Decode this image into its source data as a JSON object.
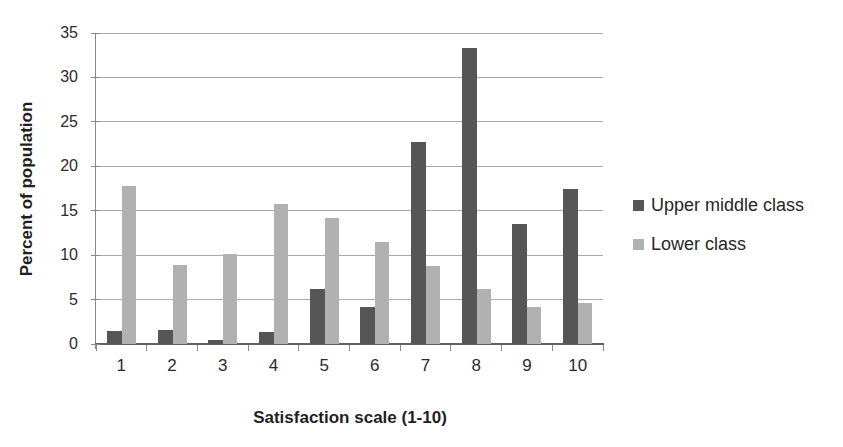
{
  "chart_data": {
    "type": "bar",
    "title": "",
    "xlabel": "Satisfaction scale (1-10)",
    "ylabel": "Percent of population",
    "categories": [
      "1",
      "2",
      "3",
      "4",
      "5",
      "6",
      "7",
      "8",
      "9",
      "10"
    ],
    "series": [
      {
        "name": "Upper middle class",
        "color": "#565656",
        "values": [
          1.5,
          1.6,
          0.4,
          1.4,
          6.2,
          4.2,
          22.7,
          33.3,
          13.5,
          17.4
        ]
      },
      {
        "name": "Lower class",
        "color": "#b1b1b1",
        "values": [
          17.8,
          8.9,
          10.1,
          15.8,
          14.2,
          11.5,
          8.8,
          6.2,
          4.2,
          4.6
        ]
      }
    ],
    "ylim": [
      0,
      35
    ],
    "yticks": [
      0,
      5,
      10,
      15,
      20,
      25,
      30,
      35
    ],
    "grid": true,
    "legend_position": "right",
    "legend_entries": [
      "Upper middle class",
      "Lower class"
    ]
  },
  "style": {
    "gridline_color": "#aaaaaa",
    "axis_color": "#8a8a8a",
    "baseline_color": "#636363",
    "text_color": "#262626",
    "background_color": "#ffffff"
  }
}
